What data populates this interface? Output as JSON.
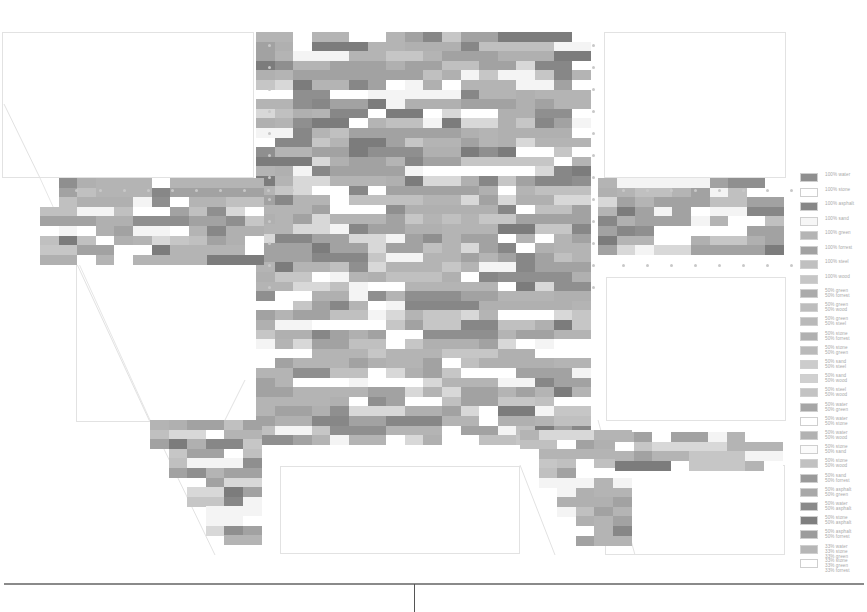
{
  "figure": {
    "title": "",
    "type": "material-grid-map",
    "grid": {
      "cell_w": 18.6,
      "cell_h": 9.6
    }
  },
  "palette": {
    "water": "#8f8f8f",
    "stone": "#ffffff",
    "asphalt": "#878787",
    "sand": "#f4f4f4",
    "green": "#b4b4b4",
    "forrest": "#a2a2a2",
    "steel": "#c0c0c0",
    "wood": "#c6c6c6",
    "mix_light": "#d8d8d8",
    "mix_mid": "#b0b0b0",
    "mix_dark": "#7c7c7c"
  },
  "legend": {
    "items": [
      {
        "swatch": "#8f8f8f",
        "label": "100% water"
      },
      {
        "swatch": "#ffffff",
        "label": "100% stone"
      },
      {
        "swatch": "#878787",
        "label": "100% asphalt"
      },
      {
        "swatch": "#f6f6f6",
        "label": "100% sand"
      },
      {
        "swatch": "#b4b4b4",
        "label": "100% green"
      },
      {
        "swatch": "#a2a2a2",
        "label": "100% forrest"
      },
      {
        "swatch": "#c0c0c0",
        "label": "100% steel"
      },
      {
        "swatch": "#c6c6c6",
        "label": "100% wood"
      },
      {
        "swatch": "#ababab",
        "label": "50% green\n50% forrest"
      },
      {
        "swatch": "#bdbdbd",
        "label": "50% green\n50% wood"
      },
      {
        "swatch": "#b9b9b9",
        "label": "50% green\n50% steel"
      },
      {
        "swatch": "#b0b0b0",
        "label": "50% stone\n50% forrest"
      },
      {
        "swatch": "#bababa",
        "label": "50% stone\n50% green"
      },
      {
        "swatch": "#cccccc",
        "label": "50% sand\n50% steel"
      },
      {
        "swatch": "#d0d0d0",
        "label": "50% sand\n50% wood"
      },
      {
        "swatch": "#c3c3c3",
        "label": "50% steel\n50% wood"
      },
      {
        "swatch": "#a6a6a6",
        "label": "50% water\n50% green"
      },
      {
        "swatch": "#ffffff",
        "label": "50% water\n50% stone"
      },
      {
        "swatch": "#b2b2b2",
        "label": "50% water\n50% wood"
      },
      {
        "swatch": "#fbfbfb",
        "label": "50% stone\n50% sand"
      },
      {
        "swatch": "#c1c1c1",
        "label": "50% stone\n50% wood"
      },
      {
        "swatch": "#9a9a9a",
        "label": "50% sand\n50% forrest"
      },
      {
        "swatch": "#a8a8a8",
        "label": "50% asphalt\n50% green"
      },
      {
        "swatch": "#8a8a8a",
        "label": "50% water\n50% asphalt"
      },
      {
        "swatch": "#7f7f7f",
        "label": "50% stone\n50% asphalt"
      },
      {
        "swatch": "#9c9c9c",
        "label": "50% asphalt\n50% forrest"
      },
      {
        "swatch": "#b6b6b6",
        "label": "33% water\n33% stone\n33% green"
      },
      {
        "swatch": "#ffffff",
        "label": "33% stone\n33% green\n33% forrest"
      }
    ]
  },
  "regions": [
    {
      "name": "central-block",
      "x": 256,
      "y": 32,
      "cols": 18,
      "rows": 43,
      "seed": 11
    },
    {
      "name": "left-arm",
      "x": 40,
      "y": 178,
      "cols": 12,
      "rows": 9,
      "seed": 23
    },
    {
      "name": "right-arm",
      "x": 598,
      "y": 178,
      "cols": 10,
      "rows": 8,
      "seed": 37
    },
    {
      "name": "lower-left-leg",
      "x": 150,
      "y": 420,
      "cols": 6,
      "rows": 13,
      "seed": 51
    },
    {
      "name": "lower-right-leg",
      "x": 520,
      "y": 430,
      "cols": 6,
      "rows": 12,
      "seed": 67
    },
    {
      "name": "right-lower-arm",
      "x": 615,
      "y": 432,
      "cols": 9,
      "rows": 4,
      "seed": 79
    }
  ],
  "outlines": [
    {
      "name": "plot-top-left",
      "x": 2,
      "y": 32,
      "w": 252,
      "h": 146
    },
    {
      "name": "plot-top-right",
      "x": 604,
      "y": 32,
      "w": 182,
      "h": 146
    },
    {
      "name": "plot-mid-left",
      "x": 76,
      "y": 262,
      "w": 190,
      "h": 160
    },
    {
      "name": "plot-mid-right",
      "x": 606,
      "y": 277,
      "w": 180,
      "h": 144
    },
    {
      "name": "plot-bottom-center",
      "x": 280,
      "y": 466,
      "w": 240,
      "h": 88
    },
    {
      "name": "plot-bottom-right",
      "x": 605,
      "y": 465,
      "w": 180,
      "h": 90
    }
  ],
  "footer": {
    "baseline": true,
    "divider_x": 414
  }
}
